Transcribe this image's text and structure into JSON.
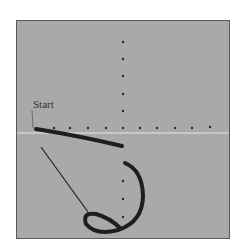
{
  "figure": {
    "label": "Start",
    "background_color": "#a9a9a9",
    "rope_color": "#1e1e1e",
    "dot_color": "#2a2a2a",
    "axis_line_color": "#e8e8e8"
  }
}
